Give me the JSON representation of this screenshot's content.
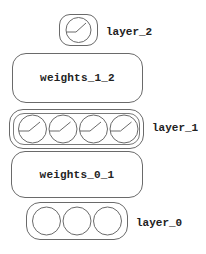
{
  "diagram": {
    "layers": [
      {
        "id": "layer_2",
        "label": "layer_2",
        "neurons": 1,
        "activated": true
      },
      {
        "id": "weights_1_2",
        "label": "weights_1_2"
      },
      {
        "id": "layer_1",
        "label": "layer_1",
        "neurons": 4,
        "activated": true
      },
      {
        "id": "weights_0_1",
        "label": "weights_0_1"
      },
      {
        "id": "layer_0",
        "label": "layer_0",
        "neurons": 3,
        "activated": false
      }
    ],
    "colors": {
      "stroke": "#6a6a6a",
      "text": "#222222",
      "background": "#ffffff"
    }
  }
}
